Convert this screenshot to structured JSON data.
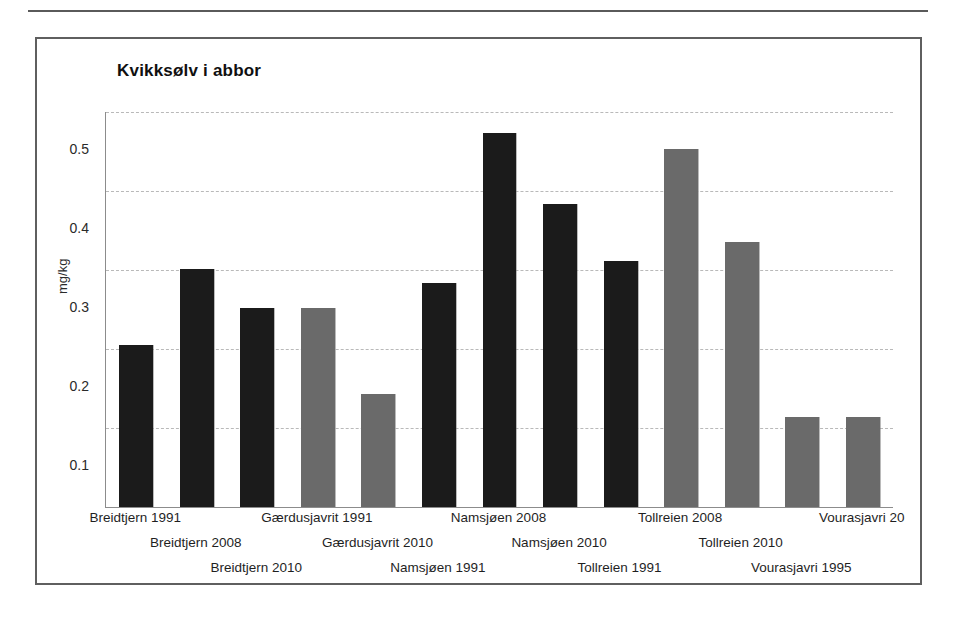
{
  "figure": {
    "title": "Kvikksølv i abbor",
    "y_axis_title": "mg/kg"
  },
  "chart_data": {
    "type": "bar",
    "title": "Kvikksølv i abbor",
    "xlabel": "",
    "ylabel": "mg/kg",
    "ylim": [
      0,
      0.5
    ],
    "ytick_labels": [
      "0.5",
      "0.4",
      "0.3",
      "0.2",
      "0.1"
    ],
    "yticks": [
      0.5,
      0.4,
      0.3,
      0.2,
      0.1
    ],
    "grid": true,
    "legend": "none",
    "categories": [
      "Breidtjern 1991",
      "Breidtjern 2008",
      "Breidtjern 2010",
      "Gærdusjavrit 1991",
      "Gærdusjavrit 2010",
      "Namsjøen 1991",
      "Namsjøen 2008",
      "Namsjøen 2010",
      "Tollreien 1991",
      "Tollreien 2008",
      "Tollreien 2010",
      "Vourasjavri 1995",
      "Vourasjavri 20"
    ],
    "values": [
      0.205,
      0.301,
      0.252,
      0.252,
      0.143,
      0.283,
      0.474,
      0.383,
      0.312,
      0.453,
      0.335,
      0.114,
      0.114
    ],
    "bar_colors": [
      "#1b1b1b",
      "#1b1b1b",
      "#1b1b1b",
      "#6a6a6a",
      "#6a6a6a",
      "#1b1b1b",
      "#1b1b1b",
      "#1b1b1b",
      "#1b1b1b",
      "#6a6a6a",
      "#6a6a6a",
      "#6a6a6a",
      "#6a6a6a"
    ],
    "label_rows": [
      0,
      1,
      2,
      0,
      1,
      2,
      0,
      1,
      2,
      0,
      1,
      2,
      0
    ]
  },
  "colors": {
    "bar_dark": "#1b1b1b",
    "bar_gray": "#6a6a6a",
    "gridline": "#b9b9b9",
    "axis": "#8c8c8c",
    "frame": "#5f5f5f",
    "text": "#1a1a1a"
  }
}
